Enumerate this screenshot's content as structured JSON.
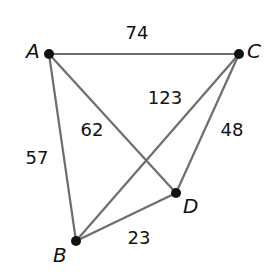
{
  "nodes": {
    "A": {
      "label": "A",
      "x": 49,
      "y": 54,
      "lx": 34,
      "ly": 57
    },
    "B": {
      "label": "B",
      "x": 76,
      "y": 241,
      "lx": 55,
      "ly": 261
    },
    "C": {
      "label": "C",
      "x": 239,
      "y": 54,
      "lx": 248,
      "ly": 57
    },
    "D": {
      "label": "D",
      "x": 176,
      "y": 193,
      "lx": 185,
      "ly": 211
    }
  },
  "edges": [
    {
      "from": "A",
      "to": "C",
      "weight": "74",
      "lx": 137,
      "ly": 39
    },
    {
      "from": "A",
      "to": "B",
      "weight": "57",
      "lx": 37,
      "ly": 164
    },
    {
      "from": "A",
      "to": "D",
      "weight": "62",
      "lx": 92,
      "ly": 136
    },
    {
      "from": "C",
      "to": "B",
      "weight": "123",
      "lx": 165,
      "ly": 104
    },
    {
      "from": "C",
      "to": "D",
      "weight": "48",
      "lx": 232,
      "ly": 136
    },
    {
      "from": "B",
      "to": "D",
      "weight": "23",
      "lx": 139,
      "ly": 244
    }
  ],
  "colors": {
    "edge": "#6d6d6d",
    "node": "#111111",
    "text": "#111111"
  }
}
